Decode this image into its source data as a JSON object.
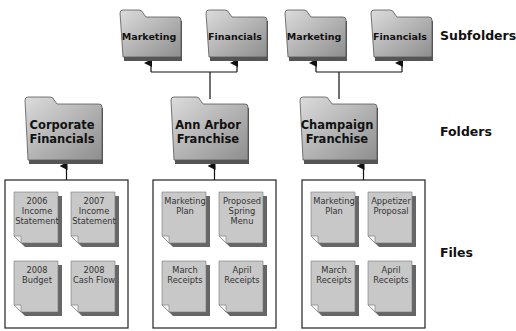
{
  "levels": {
    "subfolders": "Subfolders",
    "folders": "Folders",
    "files": "Files"
  },
  "colors": {
    "folder_fill_light": "#d4d4d4",
    "folder_fill_dark": "#9a9a9a",
    "shadow": "#555555",
    "file_fill": "#c8c8c8",
    "line": "#111111"
  },
  "folders": [
    {
      "name": "Corporate Financials",
      "lines": [
        "Corporate",
        "Financials"
      ],
      "subfolders": [],
      "files": [
        {
          "lines": [
            "2006",
            "Income",
            "Statement"
          ]
        },
        {
          "lines": [
            "2007",
            "Income",
            "Statement"
          ]
        },
        {
          "lines": [
            "2008",
            "Budget"
          ]
        },
        {
          "lines": [
            "2008",
            "Cash Flow"
          ]
        }
      ]
    },
    {
      "name": "Ann Arbor Franchise",
      "lines": [
        "Ann Arbor",
        "Franchise"
      ],
      "subfolders": [
        {
          "name": "Marketing"
        },
        {
          "name": "Financials"
        }
      ],
      "files": [
        {
          "lines": [
            "Marketing",
            "Plan"
          ]
        },
        {
          "lines": [
            "Proposed",
            "Spring",
            "Menu"
          ]
        },
        {
          "lines": [
            "March",
            "Receipts"
          ]
        },
        {
          "lines": [
            "April",
            "Receipts"
          ]
        }
      ]
    },
    {
      "name": "Champaign Franchise",
      "lines": [
        "Champaign",
        "Franchise"
      ],
      "subfolders": [
        {
          "name": "Marketing"
        },
        {
          "name": "Financials"
        }
      ],
      "files": [
        {
          "lines": [
            "Marketing",
            "Plan"
          ]
        },
        {
          "lines": [
            "Appetizer",
            "Proposal"
          ]
        },
        {
          "lines": [
            "March",
            "Receipts"
          ]
        },
        {
          "lines": [
            "April",
            "Receipts"
          ]
        }
      ]
    }
  ]
}
